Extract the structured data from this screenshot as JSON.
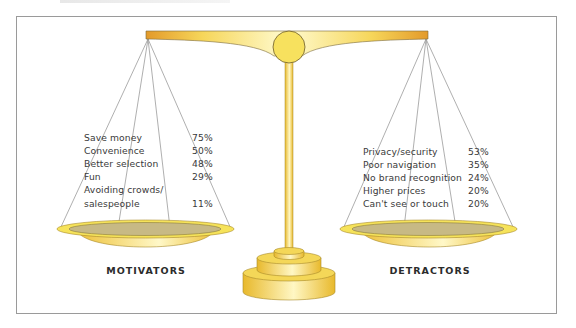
{
  "frame": {
    "border_color": "#9a9a9a"
  },
  "colors": {
    "gold_light": "#fff7b0",
    "gold": "#f6df5a",
    "gold_dark": "#e0a22c",
    "pan_inner": "#c9bb86",
    "line": "#9a9a9a"
  },
  "motivators": {
    "caption": "MOTIVATORS",
    "items": [
      {
        "label": "Save money",
        "value": "75%"
      },
      {
        "label": "Convenience",
        "value": "50%"
      },
      {
        "label": "Better selection",
        "value": "48%"
      },
      {
        "label": "Fun",
        "value": "29%"
      },
      {
        "label": "Avoiding crowds/",
        "value": ""
      },
      {
        "label": "salespeople",
        "value": "11%"
      }
    ]
  },
  "detractors": {
    "caption": "DETRACTORS",
    "items": [
      {
        "label": "Privacy/security",
        "value": "53%"
      },
      {
        "label": "Poor navigation",
        "value": "35%"
      },
      {
        "label": "No brand recognition",
        "value": "24%"
      },
      {
        "label": "Higher prices",
        "value": "20%"
      },
      {
        "label": "Can't see or touch",
        "value": "20%"
      }
    ]
  }
}
